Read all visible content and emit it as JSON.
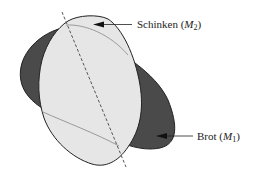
{
  "diagram": {
    "shapes": [
      {
        "id": "brot",
        "name": "Brot",
        "set_symbol": "M",
        "subscript": "1",
        "fill": "#4a4a4a",
        "stroke": "#222222"
      },
      {
        "id": "schinken",
        "name": "Schinken",
        "set_symbol": "M",
        "subscript": "2",
        "fill": "#e6e6e6",
        "stroke": "#222222"
      }
    ],
    "labels": {
      "schinken": {
        "text": "Schinken (",
        "symbol": "M",
        "sub": "2",
        "close": ")"
      },
      "brot": {
        "text": "Brot (",
        "symbol": "M",
        "sub": "1",
        "close": ")"
      }
    },
    "lines": {
      "dashed_axis": {
        "color": "#555555",
        "style": "dashed"
      },
      "hidden_edges": {
        "color": "#9a9a9a"
      }
    }
  }
}
